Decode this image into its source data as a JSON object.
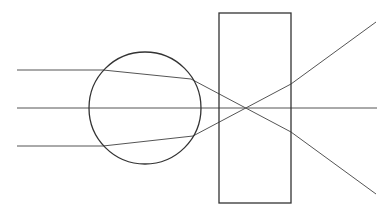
{
  "diagram": {
    "title": "",
    "stroke_color": "#333333",
    "ray_color": "#555555",
    "lens": {
      "shape": "circle",
      "cx": 145,
      "cy": 108,
      "r": 56
    },
    "slab": {
      "shape": "rectangle",
      "x": 219,
      "y": 13,
      "width": 72,
      "height": 190
    },
    "axis": {
      "x1": 17,
      "y1": 108,
      "x2": 377,
      "y2": 108
    },
    "rays": [
      {
        "name": "upper-ray",
        "points": "17,70 103,70 191,79 291,132 376,194"
      },
      {
        "name": "lower-ray",
        "points": "17,146 103,146 193,136 291,84 376,22"
      }
    ]
  }
}
